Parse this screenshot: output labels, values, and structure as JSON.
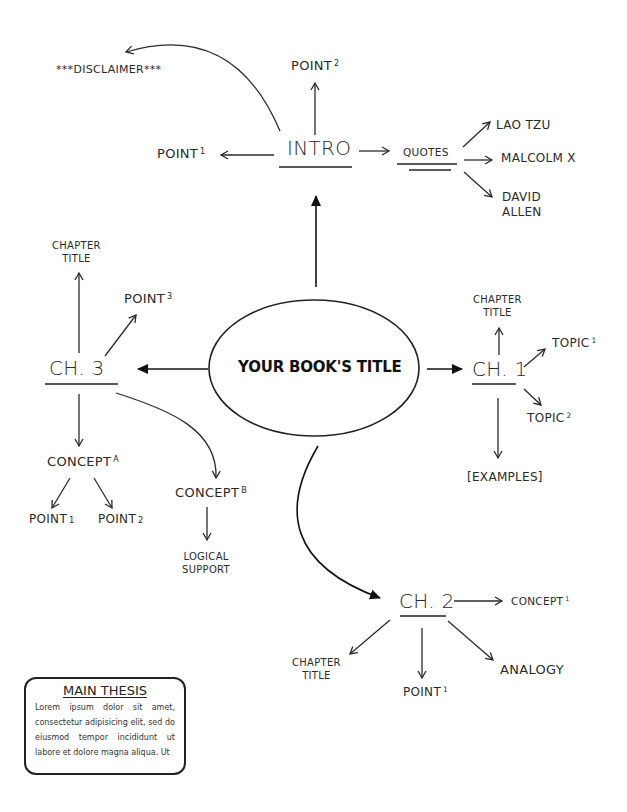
{
  "diagram": {
    "type": "mind-map",
    "central_node": {
      "label": "YOUR BOOK'S TITLE",
      "shape": "ellipse"
    },
    "branches": {
      "intro": {
        "label": "INTRO",
        "children": {
          "disclaimer": "***DISCLAIMER***",
          "point2": {
            "text": "POINT",
            "sup": "2"
          },
          "point1": {
            "text": "POINT",
            "sup": "1"
          },
          "quotes": {
            "label": "QUOTES",
            "children": [
              "LAO TZU",
              "MALCOLM X",
              "DAVID",
              "ALLEN"
            ]
          }
        }
      },
      "ch1": {
        "label": "CH. 1",
        "children": {
          "chapter_title": [
            "CHAPTER",
            "TITLE"
          ],
          "topic1": {
            "text": "TOPIC",
            "sup": "1"
          },
          "topic2": {
            "text": "TOPIC",
            "sup": "2"
          },
          "examples": "[EXAMPLES]"
        }
      },
      "ch2": {
        "label": "CH. 2",
        "children": {
          "concept1": {
            "text": "CONCEPT",
            "sup": "1"
          },
          "chapter_title": [
            "CHAPTER",
            "TITLE"
          ],
          "point1": {
            "text": "POINT",
            "sup": "1"
          },
          "analogy": "ANALOGY"
        }
      },
      "ch3": {
        "label": "CH. 3",
        "children": {
          "chapter_title": [
            "CHAPTER",
            "TITLE"
          ],
          "point3": {
            "text": "POINT",
            "sup": "3"
          },
          "conceptA": {
            "text": "CONCEPT",
            "sup": "A",
            "children": [
              {
                "text": "POINT",
                "sub": "1"
              },
              {
                "text": "POINT",
                "sub": "2"
              }
            ]
          },
          "conceptB": {
            "text": "CONCEPT",
            "sup": "B",
            "children": [
              "LOGICAL",
              "SUPPORT"
            ]
          }
        }
      }
    },
    "thesis_box": {
      "heading": "MAIN THESIS",
      "body": "Lorem ipsum dolor sit amet, consectetur adipisicing elit, sed do eiusmod tempor incididunt ut labore et dolore magna aliqua. Ut"
    },
    "colors": {
      "ink": "#2a2a2a",
      "background": "#ffffff"
    }
  }
}
